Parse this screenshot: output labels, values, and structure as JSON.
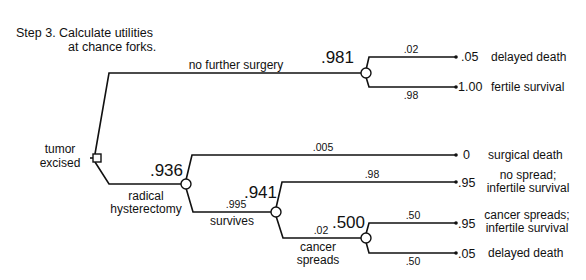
{
  "title": {
    "line1": "Step 3.  Calculate utilities",
    "line2": "at chance forks."
  },
  "decision_node": {
    "label_line1": "tumor",
    "label_line2": "excised"
  },
  "branches": {
    "no_surgery": {
      "label": "no further surgery",
      "chance_utility": ".981",
      "outcomes": [
        {
          "prob": ".02",
          "value": ".05",
          "label": "delayed death"
        },
        {
          "prob": ".98",
          "value": "1.00",
          "label": "fertile survival"
        }
      ]
    },
    "hysterectomy": {
      "label_line1": "radical",
      "label_line2": "hysterectomy",
      "chance_utility": ".936",
      "surgical_death": {
        "prob": ".005",
        "value": "0",
        "label": "surgical death"
      },
      "survives": {
        "prob": ".995",
        "label": "survives",
        "chance_utility": ".941",
        "no_spread": {
          "prob": ".98",
          "value": ".95",
          "label_line1": "no spread;",
          "label_line2": "infertile survival"
        },
        "cancer_spreads": {
          "prob": ".02",
          "label_line1": "cancer",
          "label_line2": "spreads",
          "chance_utility": ".500",
          "outcomes": [
            {
              "prob": ".50",
              "value": ".95",
              "label_line1": "cancer spreads;",
              "label_line2": "infertile survival"
            },
            {
              "prob": ".50",
              "value": ".05",
              "label": "delayed death"
            }
          ]
        }
      }
    }
  }
}
